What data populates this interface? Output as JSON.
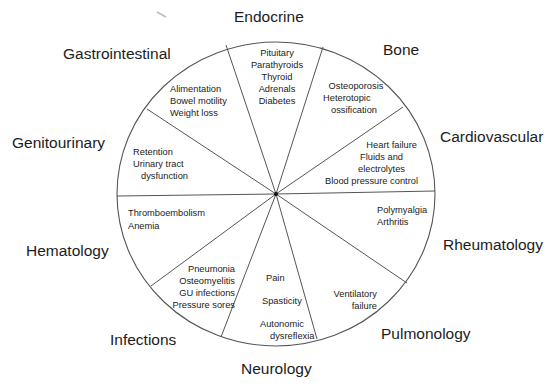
{
  "diagram": {
    "type": "wheel",
    "center_dot": true,
    "segments": [
      {
        "category": "Endocrine",
        "items": [
          "Pituitary",
          "Parathyroids",
          "Thyroid",
          "Adrenals",
          "Diabetes"
        ]
      },
      {
        "category": "Bone",
        "items": [
          "Osteoporosis",
          "Heterotopic",
          "ossification"
        ]
      },
      {
        "category": "Cardiovascular",
        "items": [
          "Heart failure",
          "Fluids and",
          "electrolytes",
          "Blood pressure control"
        ]
      },
      {
        "category": "Rheumatology",
        "items": [
          "Polymyalgia",
          "Arthritis"
        ]
      },
      {
        "category": "Pulmonology",
        "items": [
          "Ventilatory",
          "failure"
        ]
      },
      {
        "category": "Neurology",
        "items": [
          "Pain",
          "Spasticity",
          "Autonomic",
          "dysreflexia"
        ]
      },
      {
        "category": "Infections",
        "items": [
          "Pneumonia",
          "Osteomyelitis",
          "GU infections",
          "Pressure sores"
        ]
      },
      {
        "category": "Hematology",
        "items": [
          "Thromboembolism",
          "Anemia"
        ]
      },
      {
        "category": "Genitourinary",
        "items": [
          "Retention",
          "Urinary tract",
          "dysfunction"
        ]
      },
      {
        "category": "Gastrointestinal",
        "items": [
          "Alimentation",
          "Bowel motility",
          "Weight loss"
        ]
      }
    ],
    "colors": {
      "line": "#555555",
      "text": "#1c1c1c",
      "background": "#ffffff"
    }
  }
}
